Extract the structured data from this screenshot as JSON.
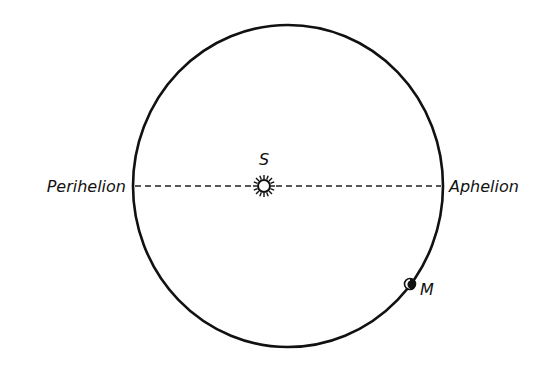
{
  "diagram": {
    "type": "orbit-diagram",
    "orbit": {
      "shape": "ellipse",
      "cx": 288,
      "cy": 186,
      "rx": 155,
      "ry": 161,
      "stroke": "#111111"
    },
    "apsidal_line": {
      "style": "dashed",
      "y": 186,
      "x1": 133,
      "x2": 443
    },
    "labels": {
      "sun": "S",
      "perihelion": "Perihelion",
      "aphelion": "Aphelion",
      "planet": "M"
    },
    "sun": {
      "cx": 264,
      "cy": 186,
      "r": 6,
      "icon": "sun-icon"
    },
    "planet": {
      "cx": 410,
      "cy": 284,
      "r": 5,
      "icon": "planet-dot-icon"
    },
    "colors": {
      "ink": "#111111",
      "background": "#ffffff"
    }
  }
}
